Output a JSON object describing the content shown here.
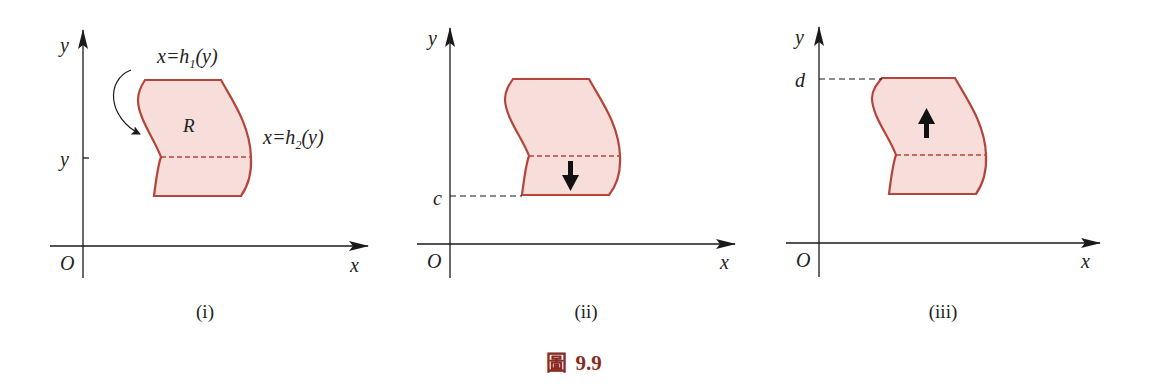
{
  "colors": {
    "region_fill": "#f7dedb",
    "region_stroke": "#b5453a",
    "axis": "#1a1a1a",
    "caption_accent": "#8b2a1e"
  },
  "panels": [
    {
      "id": "i",
      "caption": "(i)",
      "origin_label": "O",
      "x_axis_label": "x",
      "y_axis_label": "y",
      "tick_label": "y",
      "region_label": "R",
      "left_curve_label_main": "x=h",
      "left_curve_label_sub": "1",
      "left_curve_label_end": "(y)",
      "right_curve_label_main": "x=h",
      "right_curve_label_sub": "2",
      "right_curve_label_end": "(y)"
    },
    {
      "id": "ii",
      "caption": "(ii)",
      "origin_label": "O",
      "x_axis_label": "x",
      "y_axis_label": "y",
      "tick_label": "c",
      "arrow_direction": "down"
    },
    {
      "id": "iii",
      "caption": "(iii)",
      "origin_label": "O",
      "x_axis_label": "x",
      "y_axis_label": "y",
      "tick_label": "d",
      "arrow_direction": "up"
    }
  ],
  "figure": {
    "prefix": "圖",
    "number": "9.9"
  }
}
